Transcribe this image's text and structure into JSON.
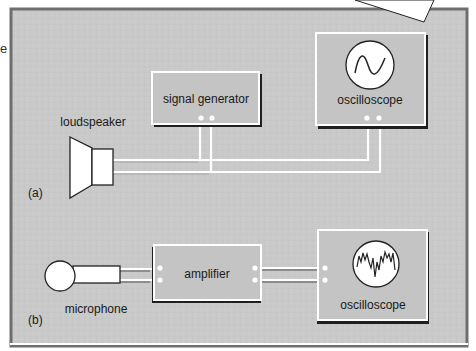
{
  "figure": {
    "side_text_fragment": "e",
    "colors": {
      "panel_fill": "#c9c9c9",
      "panel_border": "#6e6e6e",
      "box_shadow": "#2a2a2a",
      "box_highlight": "#ffffff",
      "wire": "#ffffff",
      "device_fill": "#ffffff"
    },
    "part_a": {
      "label": "(a)",
      "loudspeaker_label": "loudspeaker",
      "signal_generator_label": "signal generator",
      "oscilloscope_label": "oscilloscope",
      "oscilloscope_trace": "sine-wave"
    },
    "part_b": {
      "label": "(b)",
      "microphone_label": "microphone",
      "amplifier_label": "amplifier",
      "oscilloscope_label": "oscilloscope",
      "oscilloscope_trace": "complex-waveform"
    }
  }
}
